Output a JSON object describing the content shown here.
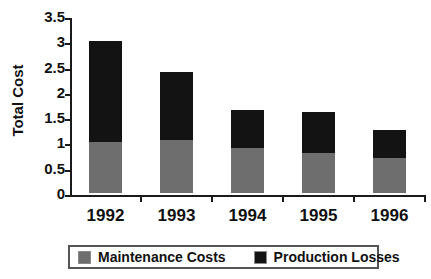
{
  "chart_data": {
    "type": "bar",
    "stacked": true,
    "title": "",
    "xlabel": "",
    "ylabel": "Total Cost",
    "categories": [
      "1992",
      "1993",
      "1994",
      "1995",
      "1996"
    ],
    "series": [
      {
        "name": "Maintenance Costs",
        "color": "#6e6e6e",
        "values": [
          1.0,
          1.05,
          0.9,
          0.8,
          0.7
        ]
      },
      {
        "name": "Production Losses",
        "color": "#131313",
        "values": [
          2.0,
          1.35,
          0.75,
          0.8,
          0.55
        ]
      }
    ],
    "totals": [
      3.0,
      2.4,
      1.65,
      1.6,
      1.25
    ],
    "ylim": [
      0,
      3.5
    ],
    "ytick_values": [
      0,
      0.5,
      1,
      1.5,
      2,
      2.5,
      3,
      3.5
    ],
    "ytick_labels": [
      "0",
      "0.5",
      "1",
      "1.5",
      "2",
      "2.5",
      "3",
      "3.5"
    ],
    "grid": false,
    "legend_position": "bottom",
    "legend_entries": [
      "Maintenance Costs",
      "Production Losses"
    ]
  },
  "axes": {
    "y_title": "Total Cost"
  },
  "legend": {
    "items": [
      {
        "label": "Maintenance Costs"
      },
      {
        "label": "Production Losses"
      }
    ]
  }
}
